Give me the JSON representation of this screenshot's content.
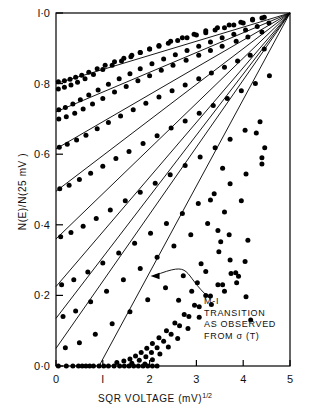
{
  "chart_data": {
    "type": "scatter",
    "title": "",
    "xlabel": "SQR VOLTAGE (mV)",
    "xlabel_sup": "1/2",
    "ylabel": "N(E)/N(25 mV )",
    "xlim": [
      0,
      5
    ],
    "ylim": [
      0.0,
      1.0
    ],
    "xticks": [
      0,
      1,
      2,
      3,
      4,
      5
    ],
    "xticklabels": [
      "0",
      "l",
      "2",
      "3",
      "4",
      "5"
    ],
    "yticks": [
      0.0,
      0.2,
      0.4,
      0.6,
      0.8,
      1.0
    ],
    "yticklabels": [
      "0·0",
      "0·2",
      "0·4",
      "0·6",
      "0·8",
      "l·0"
    ],
    "grid": false,
    "legend": null,
    "marker": "filled-circle",
    "marker_color": "#000000",
    "line_color": "#000000",
    "convergence_point": [
      5,
      1.0
    ],
    "annotations": [
      {
        "name": "mi-transition-note",
        "lines": [
          "M-I",
          "TRANSITION",
          "AS OBSERVED",
          "FROM σ (T)"
        ],
        "text_xy": [
          3.3,
          0.19
        ],
        "arrow_to": [
          2.02,
          0.255
        ],
        "arrow_style": "curved"
      }
    ],
    "fit_lines": [
      {
        "name": "line-1",
        "intercept": 0.8,
        "x0": 0.0
      },
      {
        "name": "line-2",
        "intercept": 0.72,
        "x0": 0.0
      },
      {
        "name": "line-3",
        "intercept": 0.615,
        "x0": 0.0
      },
      {
        "name": "line-4",
        "intercept": 0.495,
        "x0": 0.0
      },
      {
        "name": "line-5",
        "intercept": 0.36,
        "x0": 0.0
      },
      {
        "name": "line-6",
        "intercept": 0.225,
        "x0": 0.0
      },
      {
        "name": "line-7",
        "intercept": 0.135,
        "x0": 0.0
      },
      {
        "name": "line-8",
        "intercept": 0.05,
        "x0": 0.0
      },
      {
        "name": "line-9",
        "intercept": 0.0,
        "x0": 0.92
      }
    ],
    "series": [
      {
        "name": "curve-1",
        "x": [
          0.05,
          0.18,
          0.3,
          0.42,
          0.55,
          0.7,
          0.88,
          1.05,
          1.25,
          1.45,
          1.62,
          1.8,
          2.0,
          2.2,
          2.4,
          2.6,
          2.8,
          3.0,
          3.2,
          3.4,
          3.6,
          3.8,
          4.0,
          4.2,
          4.4
        ],
        "y": [
          0.805,
          0.808,
          0.812,
          0.818,
          0.824,
          0.832,
          0.842,
          0.852,
          0.862,
          0.872,
          0.88,
          0.888,
          0.898,
          0.906,
          0.914,
          0.922,
          0.93,
          0.938,
          0.944,
          0.952,
          0.958,
          0.966,
          0.972,
          0.98,
          0.986
        ]
      },
      {
        "name": "curve-2",
        "x": [
          0.05,
          0.18,
          0.32,
          0.46,
          0.62,
          0.8,
          1.0,
          1.2,
          1.4,
          1.6,
          1.8,
          2.0,
          2.2,
          2.45,
          2.7,
          2.95,
          3.2,
          3.45,
          3.7,
          3.95,
          4.2,
          4.45
        ],
        "y": [
          0.785,
          0.79,
          0.796,
          0.804,
          0.814,
          0.826,
          0.84,
          0.852,
          0.864,
          0.876,
          0.888,
          0.898,
          0.908,
          0.92,
          0.93,
          0.94,
          0.95,
          0.958,
          0.966,
          0.974,
          0.982,
          0.988
        ]
      },
      {
        "name": "curve-3",
        "x": [
          0.06,
          0.2,
          0.36,
          0.52,
          0.7,
          0.9,
          1.12,
          1.35,
          1.58,
          1.8,
          2.05,
          2.3,
          2.55,
          2.8,
          3.05,
          3.3,
          3.55,
          3.8,
          4.05,
          4.3,
          4.55
        ],
        "y": [
          0.726,
          0.732,
          0.742,
          0.754,
          0.768,
          0.782,
          0.798,
          0.814,
          0.828,
          0.842,
          0.856,
          0.87,
          0.882,
          0.894,
          0.906,
          0.918,
          0.93,
          0.94,
          0.952,
          0.962,
          0.972
        ]
      },
      {
        "name": "curve-4",
        "x": [
          0.06,
          0.22,
          0.4,
          0.58,
          0.78,
          1.0,
          1.25,
          1.5,
          1.75,
          2.0,
          2.25,
          2.5,
          2.78,
          3.05,
          3.3,
          3.55,
          3.85,
          4.1,
          4.4
        ],
        "y": [
          0.7,
          0.706,
          0.716,
          0.728,
          0.742,
          0.758,
          0.776,
          0.792,
          0.808,
          0.822,
          0.838,
          0.852,
          0.866,
          0.88,
          0.894,
          0.906,
          0.92,
          0.932,
          0.946
        ]
      },
      {
        "name": "curve-5",
        "x": [
          0.07,
          0.24,
          0.44,
          0.64,
          0.88,
          1.12,
          1.38,
          1.65,
          1.92,
          2.2,
          2.48,
          2.76,
          3.05,
          3.32,
          3.6,
          3.88,
          4.15,
          4.45
        ],
        "y": [
          0.62,
          0.628,
          0.64,
          0.654,
          0.672,
          0.69,
          0.708,
          0.726,
          0.744,
          0.762,
          0.78,
          0.796,
          0.814,
          0.83,
          0.846,
          0.864,
          0.88,
          0.898
        ]
      },
      {
        "name": "curve-6",
        "x": [
          0.08,
          0.28,
          0.5,
          0.74,
          1.0,
          1.28,
          1.56,
          1.86,
          2.16,
          2.46,
          2.76,
          3.06,
          3.36,
          3.66,
          3.96,
          4.26,
          4.56
        ],
        "y": [
          0.502,
          0.512,
          0.528,
          0.546,
          0.566,
          0.588,
          0.608,
          0.63,
          0.652,
          0.674,
          0.694,
          0.716,
          0.738,
          0.758,
          0.78,
          0.8,
          0.822
        ]
      },
      {
        "name": "curve-7",
        "x": [
          0.1,
          0.32,
          0.58,
          0.86,
          1.16,
          1.48,
          1.8,
          2.12,
          2.44,
          2.76,
          3.08,
          3.4,
          3.72,
          4.04,
          4.36
        ],
        "y": [
          0.366,
          0.378,
          0.396,
          0.418,
          0.442,
          0.468,
          0.492,
          0.518,
          0.542,
          0.568,
          0.592,
          0.618,
          0.642,
          0.668,
          0.692
        ]
      },
      {
        "name": "curve-8",
        "x": [
          0.12,
          0.38,
          0.68,
          1.0,
          1.34,
          1.68,
          2.02,
          2.36,
          2.7,
          3.04,
          3.38,
          3.72,
          4.06,
          4.4
        ],
        "y": [
          0.23,
          0.244,
          0.266,
          0.292,
          0.32,
          0.348,
          0.376,
          0.404,
          0.432,
          0.46,
          0.488,
          0.516,
          0.544,
          0.572
        ]
      },
      {
        "name": "curve-9",
        "x": [
          0.15,
          0.42,
          0.74,
          1.08,
          1.44,
          1.8,
          2.16,
          2.52,
          2.88,
          3.24,
          3.6,
          3.96
        ],
        "y": [
          0.14,
          0.156,
          0.182,
          0.212,
          0.244,
          0.276,
          0.308,
          0.34,
          0.372,
          0.404,
          0.436,
          0.468
        ]
      },
      {
        "name": "curve-10",
        "x": [
          0.2,
          0.5,
          0.84,
          1.2,
          1.58,
          1.96,
          2.34,
          2.72,
          3.1,
          3.48
        ],
        "y": [
          0.052,
          0.066,
          0.09,
          0.12,
          0.154,
          0.188,
          0.222,
          0.256,
          0.29,
          0.324
        ]
      },
      {
        "name": "curve-11-zero-floor",
        "x": [
          0.05,
          0.22,
          0.36,
          0.48,
          0.56,
          0.64,
          0.72,
          0.8,
          0.92,
          1.02,
          1.12,
          1.24,
          1.36,
          1.46,
          1.56,
          1.66,
          1.76,
          1.86,
          1.96,
          2.06,
          2.16
        ],
        "y": [
          0.0,
          0.0,
          0.0,
          0.0,
          0.0,
          0.0,
          0.0,
          0.0,
          0.0,
          0.0,
          0.0,
          0.0,
          0.0,
          0.0,
          0.0,
          0.0,
          0.0,
          0.0,
          0.0,
          0.0,
          0.0
        ]
      },
      {
        "name": "curve-12",
        "x": [
          1.3,
          1.45,
          1.58,
          1.7,
          1.82,
          1.94,
          2.06,
          2.2,
          2.36,
          2.54,
          2.74,
          2.96,
          3.2,
          3.46,
          3.74,
          4.04
        ],
        "y": [
          0.01,
          0.014,
          0.02,
          0.028,
          0.038,
          0.05,
          0.064,
          0.08,
          0.1,
          0.122,
          0.146,
          0.172,
          0.2,
          0.23,
          0.262,
          0.296
        ]
      },
      {
        "name": "curve-13",
        "x": [
          1.62,
          1.78,
          1.92,
          2.04,
          2.16,
          2.3,
          2.46,
          2.64,
          2.84,
          3.06,
          3.3,
          3.56,
          3.84
        ],
        "y": [
          0.008,
          0.016,
          0.026,
          0.038,
          0.052,
          0.07,
          0.09,
          0.114,
          0.14,
          0.168,
          0.198,
          0.23,
          0.264
        ]
      },
      {
        "name": "curve-14-scatter",
        "x": [
          1.9,
          2.06,
          2.22,
          2.4,
          2.6,
          2.82,
          3.06,
          3.32,
          3.6,
          3.9
        ],
        "y": [
          0.006,
          0.018,
          0.034,
          0.054,
          0.078,
          0.106,
          0.138,
          0.174,
          0.212,
          0.254
        ]
      },
      {
        "name": "mi-scatter-right",
        "x": [
          2.62,
          2.9,
          3.02,
          3.2,
          3.46,
          3.52,
          3.7,
          3.72,
          3.86,
          4.06,
          4.1,
          4.16,
          3.3,
          3.56,
          4.4,
          4.46,
          4.28
        ],
        "y": [
          0.186,
          0.212,
          0.236,
          0.268,
          0.384,
          0.352,
          0.372,
          0.3,
          0.236,
          0.196,
          0.356,
          0.13,
          0.47,
          0.56,
          0.59,
          0.618,
          0.66
        ]
      }
    ]
  },
  "figure": {
    "frame": {
      "left": 56,
      "right": 290,
      "top": 13,
      "bottom": 366
    },
    "frame_color": "#000000"
  }
}
